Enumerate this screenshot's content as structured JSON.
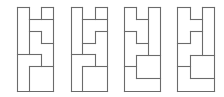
{
  "diagram": {
    "stroke_color": "#6b6b6b",
    "stroke_width": 1.1,
    "figures": [
      {
        "id": "figure-1",
        "segments": [
          [
            17,
            7,
            29,
            7
          ],
          [
            17,
            7,
            17,
            91
          ],
          [
            17,
            91,
            53,
            91
          ],
          [
            53,
            91,
            53,
            7
          ],
          [
            53,
            7,
            41,
            7
          ],
          [
            41,
            7,
            41,
            19
          ],
          [
            29,
            7,
            29,
            19
          ],
          [
            29,
            19,
            53,
            19
          ],
          [
            29,
            31,
            41,
            31
          ],
          [
            41,
            31,
            41,
            43
          ],
          [
            41,
            43,
            53,
            43
          ],
          [
            29,
            19,
            29,
            54
          ],
          [
            17,
            54,
            41,
            54
          ],
          [
            41,
            54,
            41,
            66
          ],
          [
            29,
            66,
            53,
            66
          ],
          [
            29,
            66,
            29,
            91
          ]
        ]
      },
      {
        "id": "figure-2",
        "segments": [
          [
            71,
            7,
            82,
            7
          ],
          [
            71,
            7,
            71,
            91
          ],
          [
            71,
            91,
            107,
            91
          ],
          [
            107,
            91,
            107,
            7
          ],
          [
            107,
            7,
            95,
            7
          ],
          [
            95,
            7,
            95,
            19
          ],
          [
            82,
            7,
            82,
            19
          ],
          [
            82,
            19,
            107,
            19
          ],
          [
            95,
            31,
            107,
            31
          ],
          [
            95,
            31,
            95,
            43
          ],
          [
            82,
            43,
            95,
            43
          ],
          [
            82,
            19,
            82,
            54
          ],
          [
            71,
            54,
            95,
            54
          ],
          [
            95,
            54,
            95,
            66
          ],
          [
            82,
            66,
            107,
            66
          ],
          [
            82,
            66,
            82,
            91
          ]
        ]
      },
      {
        "id": "figure-3",
        "segments": [
          [
            124,
            7,
            136,
            7
          ],
          [
            124,
            7,
            124,
            91
          ],
          [
            124,
            91,
            160,
            91
          ],
          [
            160,
            91,
            160,
            7
          ],
          [
            160,
            7,
            148,
            7
          ],
          [
            136,
            7,
            136,
            19
          ],
          [
            136,
            19,
            148,
            19
          ],
          [
            148,
            7,
            148,
            55
          ],
          [
            124,
            31,
            136,
            31
          ],
          [
            136,
            31,
            136,
            43
          ],
          [
            136,
            43,
            148,
            43
          ],
          [
            136,
            55,
            160,
            55
          ],
          [
            136,
            55,
            136,
            78
          ],
          [
            124,
            66,
            136,
            66
          ],
          [
            136,
            78,
            160,
            78
          ]
        ]
      },
      {
        "id": "figure-4",
        "segments": [
          [
            177,
            7,
            190,
            7
          ],
          [
            177,
            7,
            177,
            91
          ],
          [
            177,
            91,
            214,
            91
          ],
          [
            214,
            91,
            214,
            7
          ],
          [
            214,
            7,
            202,
            7
          ],
          [
            190,
            7,
            190,
            19
          ],
          [
            190,
            19,
            202,
            19
          ],
          [
            202,
            7,
            202,
            55
          ],
          [
            190,
            31,
            202,
            31
          ],
          [
            190,
            31,
            190,
            43
          ],
          [
            177,
            43,
            190,
            43
          ],
          [
            190,
            55,
            214,
            55
          ],
          [
            190,
            55,
            190,
            78
          ],
          [
            177,
            66,
            190,
            66
          ],
          [
            190,
            78,
            214,
            78
          ]
        ]
      }
    ]
  }
}
